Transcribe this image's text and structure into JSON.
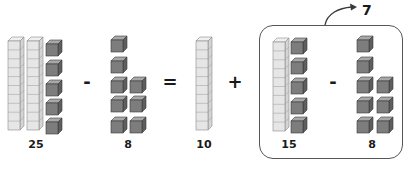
{
  "diagram": {
    "colors": {
      "rod_fill": "#e6e6e6",
      "rod_stroke": "#8a8a8a",
      "cube_front": "#7d7d7d",
      "cube_top": "#a8a8a8",
      "cube_side": "#5e5e5e",
      "cube_stroke": "#3a3a3a",
      "box_stroke": "#555555",
      "text": "#1a1a1a"
    },
    "equation": {
      "minuend": {
        "label": "25",
        "tens_rods": 2,
        "ones_cubes": 5
      },
      "op1": "-",
      "subtrahend": {
        "label": "8",
        "ones_cubes": 8
      },
      "op2": "=",
      "tens_part": {
        "label": "10",
        "tens_rods": 1
      },
      "op3": "+",
      "boxed_subtraction": {
        "left": {
          "label": "15",
          "tens_rods": 1,
          "ones_cubes": 5
        },
        "op": "-",
        "right": {
          "label": "8",
          "ones_cubes": 8
        },
        "result": "7"
      }
    }
  }
}
